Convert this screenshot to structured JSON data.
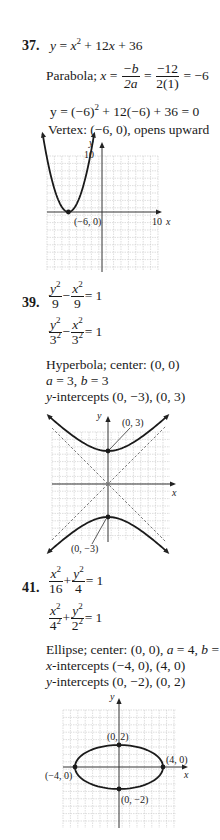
{
  "problems": [
    {
      "number": "37.",
      "equation": {
        "lhs": "y",
        "rhs_parts": [
          "x",
          "2",
          " + 12",
          "x",
          " + 36"
        ]
      },
      "line2": {
        "label": "Parabola;",
        "var": "x",
        "f1_num": "−b",
        "f1_den": "2a",
        "f2_num": "−12",
        "f2_den": "2(1)",
        "result": "= −6"
      },
      "line3": {
        "text_before": "y = (−6)",
        "exp": "2",
        "text_after": " + 12(−6) + 36 = 0"
      },
      "line4": "Vertex: (−6, 0), opens upward",
      "graph": {
        "y_axis_label": "y",
        "x_axis_label": "x",
        "y_tick_label": "10",
        "x_tick_label": "10",
        "point_label": "(−6, 0)"
      }
    },
    {
      "number": "39.",
      "eq1": {
        "t1_num": "y",
        "t1_exp": "2",
        "t1_den": "9",
        "op": "−",
        "t2_num": "x",
        "t2_exp": "2",
        "t2_den": "9",
        "rhs": "= 1"
      },
      "eq2": {
        "t1_num": "y",
        "t1_exp": "2",
        "t1_den": "3",
        "t1_den_exp": "2",
        "op": "−",
        "t2_num": "x",
        "t2_exp": "2",
        "t2_den": "3",
        "t2_den_exp": "2",
        "rhs": "= 1"
      },
      "line3": "Hyperbola; center: (0, 0)",
      "line4": {
        "a": "a",
        "a_val": " = 3, ",
        "b": "b",
        "b_val": " = 3"
      },
      "line5": {
        "var": "y",
        "text": "-intercepts (0, −3), (0, 3)"
      },
      "graph": {
        "y_axis_label": "y",
        "x_axis_label": "x",
        "top_label": "(0, 3)",
        "bottom_label": "(0, −3)"
      }
    },
    {
      "number": "41.",
      "eq1": {
        "t1_num": "x",
        "t1_exp": "2",
        "t1_den": "16",
        "op": "+",
        "t2_num": "y",
        "t2_exp": "2",
        "t2_den": "4",
        "rhs": "= 1"
      },
      "eq2": {
        "t1_num": "x",
        "t1_exp": "2",
        "t1_den": "4",
        "t1_den_exp": "2",
        "op": "+",
        "t2_num": "y",
        "t2_exp": "2",
        "t2_den": "2",
        "t2_den_exp": "2",
        "rhs": "= 1"
      },
      "line3": {
        "text1": "Ellipse; center: (0, 0), ",
        "a": "a",
        "a_val": " = 4, ",
        "b": "b",
        "b_val": " = 2"
      },
      "line4": {
        "var": "x",
        "text": "-intercepts (−4, 0), (4, 0)"
      },
      "line5": {
        "var": "y",
        "text": "-intercepts (0, −2), (0, 2)"
      },
      "graph": {
        "y_axis_label": "y",
        "x_axis_label": "x",
        "top_label": "(0, 2)",
        "bottom_label": "(0, −2)",
        "left_label": "(−4, 0)",
        "right_label": "(4, 0)"
      }
    }
  ]
}
